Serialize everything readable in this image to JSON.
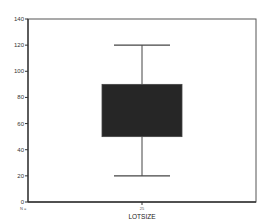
{
  "chart_data": {
    "type": "boxplot",
    "title": "",
    "xlabel": "LOTSIZE",
    "ylabel": "",
    "ylim": [
      0,
      140
    ],
    "yticks": [
      0,
      20,
      40,
      60,
      80,
      100,
      120,
      140
    ],
    "grid": false,
    "legend": null,
    "categories": [
      "LOTSIZE"
    ],
    "n_label": "N =",
    "n_values": [
      "25"
    ],
    "boxes": [
      {
        "name": "LOTSIZE",
        "n": 25,
        "whisker_low": 20,
        "q1": 50,
        "q3": 90,
        "whisker_high": 120,
        "fill_color": "#262626"
      }
    ]
  },
  "colors": {
    "box_fill": "#262626",
    "axis": "#333333",
    "frame": "#555555",
    "whisker": "#444444"
  }
}
